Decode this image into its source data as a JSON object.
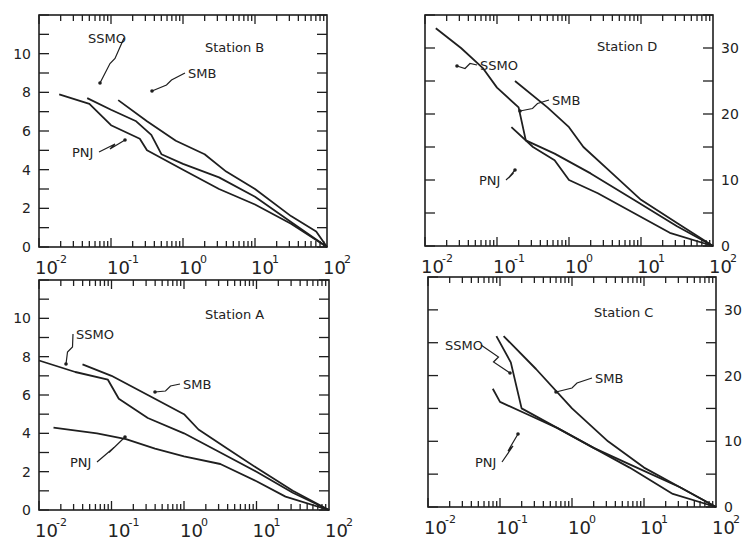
{
  "figure": {
    "panel_label": "",
    "colors": {
      "line": "#1f1f1f",
      "axis": "#1f1f1f",
      "background": "#ffffff"
    }
  },
  "chart_data": [
    {
      "type": "line",
      "title": "Station B",
      "xscale": "log",
      "xlim": [
        0.01,
        100
      ],
      "x_tick_labels": [
        "10^-2",
        "10^-1",
        "10^0",
        "10^1",
        "10^2"
      ],
      "ylim": [
        0,
        12
      ],
      "y_tick_labels": [
        "0",
        "2",
        "4",
        "6",
        "8",
        "10"
      ],
      "y_axis_side": "left",
      "grid": false,
      "legend": "inline annotations",
      "series": [
        {
          "name": "SSMO",
          "x_log10": [
            -1.33,
            -1.0,
            -0.65,
            -0.44,
            -0.3,
            0.0,
            0.5,
            1.0,
            1.5,
            2.0
          ],
          "y": [
            7.7,
            7.1,
            6.5,
            5.8,
            4.8,
            4.3,
            3.6,
            2.6,
            1.3,
            0.0
          ]
        },
        {
          "name": "SMB",
          "x_log10": [
            -0.9,
            -0.5,
            -0.1,
            0.3,
            0.6,
            1.0,
            1.5,
            1.85,
            2.0
          ],
          "y": [
            7.6,
            6.5,
            5.5,
            4.8,
            3.9,
            3.0,
            1.6,
            0.8,
            0.0
          ]
        },
        {
          "name": "PNJ",
          "x_log10": [
            -1.72,
            -1.3,
            -1.0,
            -0.6,
            -0.5,
            0.0,
            0.5,
            1.0,
            1.5,
            2.0
          ],
          "y": [
            7.9,
            7.4,
            6.3,
            5.6,
            5.0,
            4.0,
            3.0,
            2.2,
            1.2,
            0.0
          ]
        }
      ],
      "annotations": [
        "SSMO",
        "SMB",
        "PNJ"
      ]
    },
    {
      "type": "line",
      "title": "Station D",
      "xscale": "log",
      "xlim": [
        0.01,
        100
      ],
      "x_tick_labels": [
        "10^-2",
        "10^-1",
        "10^0",
        "10^1",
        "10^2"
      ],
      "ylim": [
        0,
        35
      ],
      "y_tick_labels": [
        "0",
        "10",
        "20",
        "30"
      ],
      "y_axis_side": "right",
      "grid": false,
      "legend": "inline annotations",
      "series": [
        {
          "name": "SSMO",
          "x_log10": [
            -1.85,
            -1.5,
            -1.2,
            -1.0,
            -0.7,
            -0.6,
            -0.2,
            0.3,
            0.9,
            1.5,
            2.0
          ],
          "y": [
            33,
            30,
            27,
            24,
            21,
            16,
            14,
            11,
            7,
            3,
            0
          ]
        },
        {
          "name": "SMB",
          "x_log10": [
            -0.75,
            -0.3,
            0.0,
            0.2,
            0.6,
            1.0,
            1.5,
            2.0
          ],
          "y": [
            25,
            21,
            18,
            15,
            11,
            7,
            3.5,
            0
          ]
        },
        {
          "name": "PNJ",
          "x_log10": [
            -0.8,
            -0.5,
            -0.2,
            0.0,
            0.4,
            0.9,
            1.4,
            2.0
          ],
          "y": [
            18,
            15,
            13,
            10,
            8,
            5,
            2,
            0
          ]
        }
      ],
      "annotations": [
        "SSMO",
        "SMB",
        "PNJ"
      ]
    },
    {
      "type": "line",
      "title": "Station A",
      "xscale": "log",
      "xlim": [
        0.01,
        100
      ],
      "x_tick_labels": [
        "10^-2",
        "10^-1",
        "10^0",
        "10^1",
        "10^2"
      ],
      "ylim": [
        0,
        12
      ],
      "y_tick_labels": [
        "0",
        "2",
        "4",
        "6",
        "8",
        "10"
      ],
      "y_axis_side": "left",
      "grid": false,
      "legend": "inline annotations",
      "series": [
        {
          "name": "SSMO",
          "x_log10": [
            -2.0,
            -1.5,
            -1.05,
            -0.9,
            -0.5,
            0.0,
            0.5,
            1.0,
            1.5,
            2.0
          ],
          "y": [
            7.8,
            7.2,
            6.8,
            5.8,
            4.8,
            4.0,
            3.0,
            2.0,
            0.9,
            0.0
          ]
        },
        {
          "name": "SMB",
          "x_log10": [
            -1.4,
            -1.0,
            -0.5,
            0.0,
            0.2,
            0.6,
            1.0,
            1.5,
            2.0
          ],
          "y": [
            7.6,
            7.0,
            6.0,
            5.0,
            4.2,
            3.2,
            2.2,
            1.0,
            0.0
          ]
        },
        {
          "name": "PNJ",
          "x_log10": [
            -1.8,
            -1.2,
            -0.8,
            -0.4,
            0.0,
            0.5,
            1.0,
            1.4,
            2.0
          ],
          "y": [
            4.3,
            4.0,
            3.7,
            3.2,
            2.8,
            2.4,
            1.5,
            0.7,
            0.0
          ]
        }
      ],
      "annotations": [
        "SSMO",
        "SMB",
        "PNJ"
      ]
    },
    {
      "type": "line",
      "title": "Station C",
      "xscale": "log",
      "xlim": [
        0.01,
        100
      ],
      "x_tick_labels": [
        "10^-2",
        "10^-1",
        "10^0",
        "10^1",
        "10^2"
      ],
      "ylim": [
        0,
        35
      ],
      "y_tick_labels": [
        "0",
        "10",
        "20",
        "30"
      ],
      "y_axis_side": "right",
      "grid": false,
      "legend": "inline annotations",
      "series": [
        {
          "name": "SSMO",
          "x_log10": [
            -1.05,
            -0.85,
            -0.7,
            -0.2,
            0.3,
            0.9,
            1.5,
            2.0
          ],
          "y": [
            26,
            22,
            15,
            12,
            9,
            6,
            3,
            0
          ]
        },
        {
          "name": "SMB",
          "x_log10": [
            -0.95,
            -0.5,
            0.0,
            0.5,
            1.0,
            1.5,
            2.0
          ],
          "y": [
            26,
            21,
            15,
            10,
            6,
            3,
            0
          ]
        },
        {
          "name": "PNJ",
          "x_log10": [
            -1.1,
            -1.0,
            -0.6,
            -0.2,
            0.3,
            0.8,
            1.4,
            2.0
          ],
          "y": [
            18,
            16,
            14,
            12,
            9,
            6,
            2,
            0
          ]
        }
      ],
      "annotations": [
        "SSMO",
        "SMB",
        "PNJ"
      ]
    }
  ]
}
